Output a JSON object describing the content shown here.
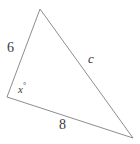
{
  "figure": {
    "type": "triangle-diagram",
    "background_color": "#ffffff",
    "stroke_color": "#808080",
    "stroke_width": 0.9,
    "text_color": "#3a3a3a",
    "canvas": {
      "width": 140,
      "height": 144
    },
    "vertices": {
      "top": {
        "x": 40,
        "y": 9
      },
      "bottom_left": {
        "x": 7,
        "y": 97
      },
      "bottom_right": {
        "x": 133,
        "y": 138
      }
    },
    "path": "M 40 9 L 7 97 L 133 138 Z",
    "labels": {
      "left_side": "6",
      "bottom_side": "8",
      "right_side": "c",
      "angle_value": "x",
      "angle_degree_symbol": "°"
    }
  }
}
